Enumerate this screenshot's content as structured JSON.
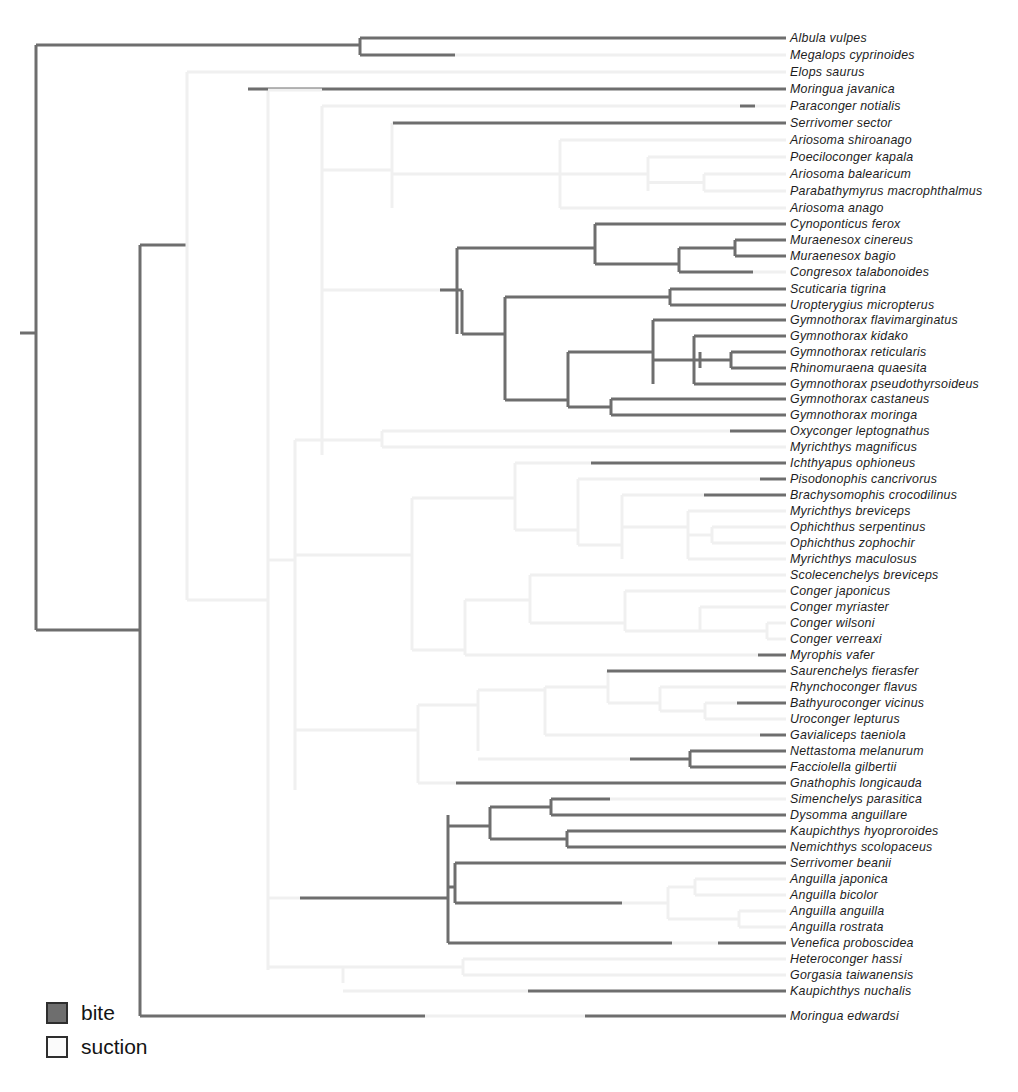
{
  "figure": {
    "type": "phylogenetic-tree",
    "orientation": "left-to-right rectangular cladogram",
    "width": 1018,
    "height": 1092,
    "background": "#ffffff"
  },
  "legend": {
    "position": "bottom-left",
    "items": [
      {
        "label": "bite",
        "color": "#6e6e6e",
        "state": "bite"
      },
      {
        "label": "suction",
        "color": "#fbfbfb",
        "state": "suction"
      }
    ]
  },
  "colors": {
    "bite": "#6e6e6e",
    "suction": "#f0f0f0",
    "label": "#1d1d1d"
  },
  "chart_data": {
    "type": "tree",
    "title": "",
    "n_taxa": 62,
    "character": "feeding mode",
    "states": [
      "bite",
      "suction"
    ],
    "taxa": [
      {
        "name": "Albula vulpes",
        "state": "bite",
        "y": 38,
        "tip_x": 437
      },
      {
        "name": "Megalops cyprinoides",
        "state": "bite",
        "y": 55,
        "tip_x": 455
      },
      {
        "name": "Elops saurus",
        "state": "suction",
        "y": 72,
        "tip_x": 560
      },
      {
        "name": "Moringua javanica",
        "state": "bite",
        "y": 89,
        "tip_x": 248
      },
      {
        "name": "Paraconger notialis",
        "state": "bite",
        "y": 106,
        "tip_x": 740
      },
      {
        "name": "Serrivomer sector",
        "state": "bite",
        "y": 123,
        "tip_x": 393
      },
      {
        "name": "Ariosoma shiroanago",
        "state": "suction",
        "y": 140,
        "tip_x": 661
      },
      {
        "name": "Poeciloconger kapala",
        "state": "suction",
        "y": 157,
        "tip_x": 703
      },
      {
        "name": "Ariosoma balearicum",
        "state": "suction",
        "y": 174,
        "tip_x": 704
      },
      {
        "name": "Parabathymyrus macrophthalmus",
        "state": "suction",
        "y": 191,
        "tip_x": 682
      },
      {
        "name": "Ariosoma anago",
        "state": "suction",
        "y": 208,
        "tip_x": 646
      },
      {
        "name": "Cynoponticus ferox",
        "state": "bite",
        "y": 224,
        "tip_x": 594
      },
      {
        "name": "Muraenesox cinereus",
        "state": "bite",
        "y": 240,
        "tip_x": 735
      },
      {
        "name": "Muraenesox bagio",
        "state": "bite",
        "y": 256,
        "tip_x": 735
      },
      {
        "name": "Congresox talabonoides",
        "state": "bite",
        "y": 272,
        "tip_x": 679
      },
      {
        "name": "Scuticaria tigrina",
        "state": "bite",
        "y": 289,
        "tip_x": 670
      },
      {
        "name": "Uropterygius micropterus",
        "state": "bite",
        "y": 305,
        "tip_x": 670
      },
      {
        "name": "Gymnothorax flavimarginatus",
        "state": "bite",
        "y": 320,
        "tip_x": 653
      },
      {
        "name": "Gymnothorax kidako",
        "state": "bite",
        "y": 336,
        "tip_x": 694
      },
      {
        "name": "Gymnothorax reticularis",
        "state": "bite",
        "y": 352,
        "tip_x": 731
      },
      {
        "name": "Rhinomuraena quaesita",
        "state": "bite",
        "y": 368,
        "tip_x": 731
      },
      {
        "name": "Gymnothorax pseudothyrsoideus",
        "state": "bite",
        "y": 384,
        "tip_x": 694
      },
      {
        "name": "Gymnothorax castaneus",
        "state": "bite",
        "y": 399,
        "tip_x": 611
      },
      {
        "name": "Gymnothorax moringa",
        "state": "bite",
        "y": 415,
        "tip_x": 611
      },
      {
        "name": "Oxyconger leptognathus",
        "state": "bite",
        "y": 431,
        "tip_x": 730
      },
      {
        "name": "Myrichthys magnificus",
        "state": "suction",
        "y": 447,
        "tip_x": 733
      },
      {
        "name": "Ichthyapus ophioneus",
        "state": "bite",
        "y": 463,
        "tip_x": 591
      },
      {
        "name": "Pisodonophis cancrivorus",
        "state": "bite",
        "y": 479,
        "tip_x": 760
      },
      {
        "name": "Brachysomophis crocodilinus",
        "state": "bite",
        "y": 495,
        "tip_x": 704
      },
      {
        "name": "Myrichthys breviceps",
        "state": "suction",
        "y": 511,
        "tip_x": 702
      },
      {
        "name": "Ophichthus serpentinus",
        "state": "suction",
        "y": 527,
        "tip_x": 712
      },
      {
        "name": "Ophichthus zophochir",
        "state": "suction",
        "y": 543,
        "tip_x": 712
      },
      {
        "name": "Myrichthys maculosus",
        "state": "suction",
        "y": 559,
        "tip_x": 691
      },
      {
        "name": "Scolecenchelys breviceps",
        "state": "suction",
        "y": 575,
        "tip_x": 745
      },
      {
        "name": "Conger japonicus",
        "state": "suction",
        "y": 591,
        "tip_x": 745
      },
      {
        "name": "Conger myriaster",
        "state": "suction",
        "y": 607,
        "tip_x": 745
      },
      {
        "name": "Conger wilsoni",
        "state": "suction",
        "y": 623,
        "tip_x": 767
      },
      {
        "name": "Conger verreaxi",
        "state": "suction",
        "y": 639,
        "tip_x": 767
      },
      {
        "name": "Myrophis vafer",
        "state": "bite",
        "y": 655,
        "tip_x": 758
      },
      {
        "name": "Saurenchelys fierasfer",
        "state": "bite",
        "y": 671,
        "tip_x": 607
      },
      {
        "name": "Rhynchoconger flavus",
        "state": "suction",
        "y": 687,
        "tip_x": 736
      },
      {
        "name": "Bathyuroconger vicinus",
        "state": "bite",
        "y": 703,
        "tip_x": 737
      },
      {
        "name": "Uroconger lepturus",
        "state": "suction",
        "y": 719,
        "tip_x": 741
      },
      {
        "name": "Gavialiceps taeniola",
        "state": "bite",
        "y": 735,
        "tip_x": 760
      },
      {
        "name": "Nettastoma melanurum",
        "state": "bite",
        "y": 751,
        "tip_x": 690
      },
      {
        "name": "Facciolella gilbertii",
        "state": "bite",
        "y": 767,
        "tip_x": 690
      },
      {
        "name": "Gnathophis longicauda",
        "state": "bite",
        "y": 783,
        "tip_x": 456
      },
      {
        "name": "Simenchelys parasitica",
        "state": "bite",
        "y": 799,
        "tip_x": 610
      },
      {
        "name": "Dysomma anguillare",
        "state": "bite",
        "y": 815,
        "tip_x": 610
      },
      {
        "name": "Kaupichthys hyoproroides",
        "state": "bite",
        "y": 831,
        "tip_x": 567
      },
      {
        "name": "Nemichthys scolopaceus",
        "state": "bite",
        "y": 847,
        "tip_x": 567
      },
      {
        "name": "Serrivomer beanii",
        "state": "bite",
        "y": 863,
        "tip_x": 551
      },
      {
        "name": "Anguilla japonica",
        "state": "suction",
        "y": 879,
        "tip_x": 695
      },
      {
        "name": "Anguilla bicolor",
        "state": "suction",
        "y": 895,
        "tip_x": 695
      },
      {
        "name": "Anguilla anguilla",
        "state": "suction",
        "y": 911,
        "tip_x": 739
      },
      {
        "name": "Anguilla rostrata",
        "state": "suction",
        "y": 927,
        "tip_x": 739
      },
      {
        "name": "Venefica proboscidea",
        "state": "bite",
        "y": 943,
        "tip_x": 672
      },
      {
        "name": "Heteroconger hassi",
        "state": "suction",
        "y": 959,
        "tip_x": 463
      },
      {
        "name": "Gorgasia taiwanensis",
        "state": "suction",
        "y": 975,
        "tip_x": 463
      },
      {
        "name": "Kaupichthys nuchalis",
        "state": "bite",
        "y": 991,
        "tip_x": 528
      },
      {
        "name": "Moringua edwardsi",
        "state": "bite",
        "y": 1016,
        "tip_x": 213
      }
    ],
    "label_x": 790,
    "tip_end_x": 786
  }
}
